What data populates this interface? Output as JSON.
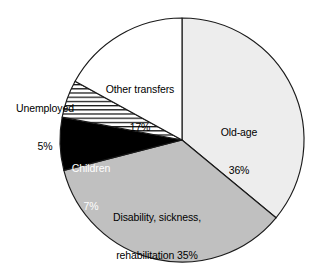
{
  "chart_data": {
    "type": "pie",
    "title": "",
    "subtitle": "",
    "xlabel": "",
    "ylabel": "",
    "legend_position": "none",
    "grid": false,
    "units": "percent",
    "start_angle_deg": 0,
    "direction": "clockwise",
    "categories": [
      "Old-age",
      "Disability, sickness, rehabilitation",
      "Children",
      "Unemployed",
      "Other transfers"
    ],
    "values": [
      36,
      35,
      7,
      5,
      17
    ],
    "slices": [
      {
        "name": "old-age",
        "label_line1": "Old-age",
        "label_line2": "36%",
        "value": 36,
        "fill": "#ededed",
        "pattern": "solid",
        "text_color": "#000000",
        "label_x": 239,
        "label_y": 101
      },
      {
        "name": "disability-sickness-rehabilitation",
        "label_line1": "Disability, sickness,",
        "label_line2": "rehabilitation 35%",
        "value": 35,
        "fill": "#c0c0c0",
        "pattern": "solid",
        "text_color": "#000000",
        "label_x": 157,
        "label_y": 186
      },
      {
        "name": "children",
        "label_line1": "Children",
        "label_line2": "7%",
        "value": 7,
        "fill": "#000000",
        "pattern": "solid",
        "text_color": "#ffffff",
        "label_x": 91,
        "label_y": 137
      },
      {
        "name": "unemployed",
        "label_line1": "Unemployed",
        "label_line2": "5%",
        "value": 5,
        "fill": "#ffffff",
        "pattern": "horizontal-lines",
        "text_color": "#000000",
        "label_x": 45,
        "label_y": 77
      },
      {
        "name": "other-transfers",
        "label_line1": "Other transfers",
        "label_line2": "17%",
        "value": 17,
        "fill": "#ffffff",
        "pattern": "solid",
        "text_color": "#000000",
        "label_x": 140,
        "label_y": 58
      }
    ],
    "geometry": {
      "center_x": 182,
      "center_y": 140,
      "radius": 122
    },
    "colors": {
      "outline": "#1a1a1a",
      "background": "#ffffff",
      "old_age_fill": "#ededed",
      "disability_fill": "#c0c0c0",
      "children_fill": "#000000",
      "unemployed_fill": "#ffffff",
      "other_transfers_fill": "#ffffff"
    }
  }
}
